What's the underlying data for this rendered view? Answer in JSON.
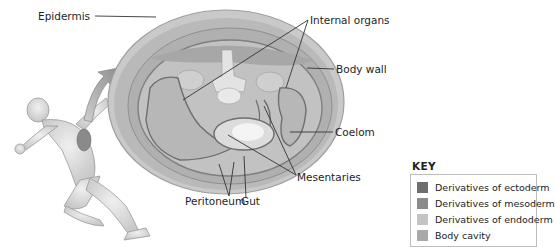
{
  "diagram": {
    "labels": {
      "epidermis": "Epidermis",
      "internal_organs": "Internal organs",
      "body_wall": "Body wall",
      "coelom": "Coelom",
      "mesentaries": "Mesentaries",
      "peritoneum": "Peritoneum",
      "gut": "Gut"
    },
    "key": {
      "title": "KEY",
      "items": [
        {
          "label": "Derivatives of ectoderm",
          "color": "#6e6e6e"
        },
        {
          "label": "Derivatives of mesoderm",
          "color": "#8a8a8a"
        },
        {
          "label": "Derivatives of endoderm",
          "color": "#c4c4c4"
        },
        {
          "label": "Body cavity",
          "color": "#a9a9a9"
        }
      ]
    },
    "figure": {
      "subject": "running-human",
      "inset": "cross-section-of-torso"
    }
  }
}
